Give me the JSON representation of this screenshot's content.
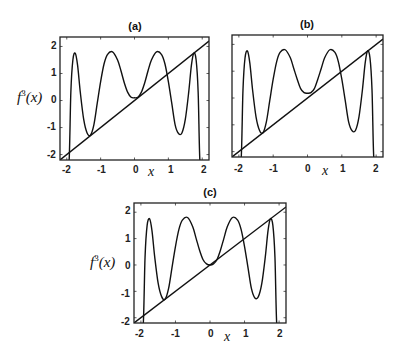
{
  "chart_data": [
    {
      "type": "line",
      "title": "(a)",
      "xlabel": "x",
      "ylabel": "f^3(x)",
      "xlim": [
        -2.2,
        2.2
      ],
      "ylim": [
        -2.2,
        2.35
      ],
      "xticks": [
        -2,
        -1,
        0,
        1,
        2
      ],
      "yticks": [
        -2,
        -1,
        0,
        1,
        2
      ],
      "show_yticklabels": true,
      "grid": false,
      "series": [
        {
          "name": "f^3(x)",
          "x": [
            -2.0,
            -1.93,
            -1.88,
            -1.82,
            -1.75,
            -1.68,
            -1.6,
            -1.5,
            -1.4,
            -1.3,
            -1.2,
            -1.1,
            -1.0,
            -0.9,
            -0.8,
            -0.65,
            -0.5,
            -0.4,
            -0.3,
            -0.2,
            -0.1,
            0.0,
            0.1,
            0.2,
            0.3,
            0.4,
            0.5,
            0.65,
            0.8,
            0.9,
            1.0,
            1.1,
            1.2,
            1.3,
            1.4,
            1.5,
            1.6,
            1.68,
            1.75,
            1.82,
            1.88,
            1.93,
            2.0
          ],
          "y": [
            -2.4,
            -2.2,
            0.3,
            1.5,
            1.75,
            1.3,
            0.3,
            -0.7,
            -1.2,
            -1.28,
            -0.9,
            -0.1,
            0.7,
            1.35,
            1.7,
            1.8,
            1.5,
            1.1,
            0.65,
            0.3,
            0.12,
            0.1,
            0.12,
            0.3,
            0.65,
            1.1,
            1.5,
            1.8,
            1.7,
            1.35,
            0.7,
            -0.1,
            -0.9,
            -1.22,
            -1.2,
            -0.7,
            0.3,
            1.3,
            1.75,
            1.5,
            0.3,
            -2.2,
            -2.4
          ]
        },
        {
          "name": "y = x",
          "x": [
            -2.2,
            2.2
          ],
          "y": [
            -2.2,
            2.2
          ]
        }
      ]
    },
    {
      "type": "line",
      "title": "(b)",
      "xlabel": "x",
      "ylabel": "",
      "xlim": [
        -2.2,
        2.2
      ],
      "ylim": [
        -2.2,
        2.35
      ],
      "xticks": [
        -2,
        -1,
        0,
        1,
        2
      ],
      "yticks": [
        -2,
        -1,
        0,
        1,
        2
      ],
      "show_yticklabels": false,
      "grid": false,
      "series": [
        {
          "name": "f^3(x)",
          "x": [
            -2.0,
            -1.93,
            -1.88,
            -1.82,
            -1.75,
            -1.68,
            -1.6,
            -1.5,
            -1.4,
            -1.3,
            -1.2,
            -1.1,
            -1.0,
            -0.9,
            -0.8,
            -0.65,
            -0.5,
            -0.4,
            -0.3,
            -0.2,
            -0.1,
            0.0,
            0.1,
            0.2,
            0.3,
            0.4,
            0.5,
            0.65,
            0.8,
            0.9,
            1.0,
            1.1,
            1.2,
            1.3,
            1.4,
            1.5,
            1.6,
            1.68,
            1.75,
            1.82,
            1.88,
            1.93,
            2.0
          ],
          "y": [
            -2.4,
            -2.2,
            0.3,
            1.5,
            1.75,
            1.3,
            0.3,
            -0.7,
            -1.2,
            -1.3,
            -0.9,
            -0.1,
            0.7,
            1.35,
            1.7,
            1.8,
            1.5,
            1.1,
            0.7,
            0.35,
            0.2,
            0.18,
            0.2,
            0.35,
            0.7,
            1.1,
            1.5,
            1.8,
            1.7,
            1.35,
            0.7,
            -0.1,
            -0.9,
            -1.22,
            -1.2,
            -0.7,
            0.3,
            1.3,
            1.75,
            1.5,
            0.3,
            -2.2,
            -2.4
          ]
        },
        {
          "name": "y = x",
          "x": [
            -2.2,
            2.2
          ],
          "y": [
            -2.2,
            2.2
          ]
        }
      ]
    },
    {
      "type": "line",
      "title": "(c)",
      "xlabel": "x",
      "ylabel": "f^3(x)",
      "xlim": [
        -2.2,
        2.2
      ],
      "ylim": [
        -2.2,
        2.35
      ],
      "xticks": [
        -2,
        -1,
        0,
        1,
        2
      ],
      "yticks": [
        -2,
        -1,
        0,
        1,
        2
      ],
      "show_yticklabels": true,
      "grid": false,
      "series": [
        {
          "name": "f^3(x)",
          "x": [
            -2.0,
            -1.93,
            -1.88,
            -1.82,
            -1.75,
            -1.68,
            -1.6,
            -1.5,
            -1.4,
            -1.3,
            -1.2,
            -1.1,
            -1.0,
            -0.9,
            -0.8,
            -0.65,
            -0.5,
            -0.4,
            -0.3,
            -0.2,
            -0.1,
            0.0,
            0.1,
            0.2,
            0.3,
            0.4,
            0.5,
            0.65,
            0.8,
            0.9,
            1.0,
            1.1,
            1.2,
            1.3,
            1.4,
            1.5,
            1.6,
            1.68,
            1.75,
            1.82,
            1.88,
            1.93,
            2.0
          ],
          "y": [
            -2.4,
            -2.2,
            0.3,
            1.5,
            1.75,
            1.3,
            0.3,
            -0.7,
            -1.2,
            -1.3,
            -0.9,
            -0.1,
            0.7,
            1.35,
            1.7,
            1.8,
            1.45,
            1.0,
            0.55,
            0.2,
            0.04,
            0.0,
            0.04,
            0.2,
            0.55,
            1.0,
            1.45,
            1.8,
            1.7,
            1.35,
            0.7,
            -0.1,
            -0.9,
            -1.25,
            -1.2,
            -0.7,
            0.3,
            1.3,
            1.75,
            1.5,
            0.3,
            -2.2,
            -2.4
          ]
        },
        {
          "name": "y = x",
          "x": [
            -2.2,
            2.2
          ],
          "y": [
            -2.2,
            2.2
          ]
        }
      ]
    }
  ],
  "panels": [
    {
      "title": "(a)",
      "ylabel_base": "f",
      "ylabel_sup": "3",
      "ylabel_arg": "(x)",
      "xlabel": "x",
      "xticklabels": [
        "-2",
        "-1",
        "0",
        "1",
        "2"
      ],
      "yticklabels": [
        "2",
        "1",
        "0",
        "-1",
        "-2"
      ]
    },
    {
      "title": "(b)",
      "xlabel": "x",
      "xticklabels": [
        "-2",
        "-1",
        "0",
        "1",
        "2"
      ]
    },
    {
      "title": "(c)",
      "ylabel_base": "f",
      "ylabel_sup": "3",
      "ylabel_arg": "(x)",
      "xlabel": "x",
      "xticklabels": [
        "-2",
        "-1",
        "0",
        "1",
        "2"
      ],
      "yticklabels": [
        "2",
        "1",
        "0",
        "-1",
        "-2"
      ]
    }
  ]
}
